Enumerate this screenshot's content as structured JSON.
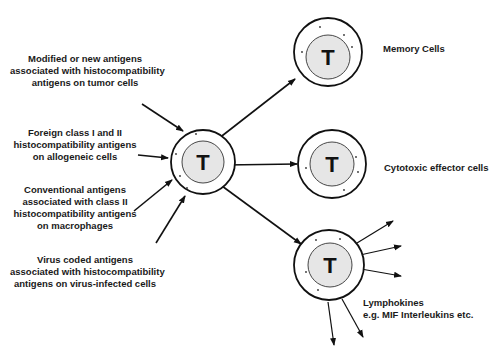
{
  "diagram": {
    "inputs": [
      {
        "lines": [
          "Modified or new antigens",
          "associated with histocompatibility",
          "antigens on tumor cells"
        ]
      },
      {
        "lines": [
          "Foreign class I and II",
          "histocompatibility antigens",
          "on allogeneic cells"
        ]
      },
      {
        "lines": [
          "Conventional antigens",
          "associated with class II",
          "histocompatibility antigens",
          "on macrophages"
        ]
      },
      {
        "lines": [
          "Virus coded antigens",
          "associated with histocompatibility",
          "antigens on virus-infected cells"
        ]
      }
    ],
    "central_cell": {
      "letter": "T"
    },
    "outputs": [
      {
        "cell_letter": "T",
        "lines": [
          "Memory Cells"
        ]
      },
      {
        "cell_letter": "T",
        "lines": [
          "Cytotoxic effector cells"
        ]
      },
      {
        "cell_letter": "T",
        "lines": [
          "Lymphokines",
          "e.g. MIF Interleukins etc."
        ]
      }
    ],
    "colors": {
      "line": "#111111",
      "nucleus_fill": "#e6e6e6",
      "cell_fill": "#ffffff"
    }
  }
}
